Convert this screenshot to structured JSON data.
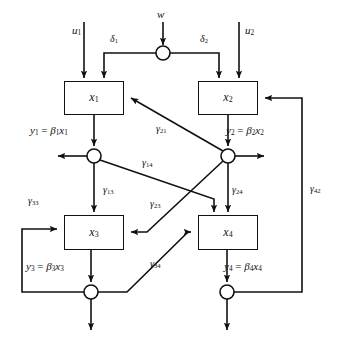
{
  "diagram": {
    "stroke_color": "#111111",
    "background_color": "#ffffff",
    "blocks": [
      {
        "id": "x1",
        "label": "x",
        "sub": "1",
        "x": 64,
        "y": 81,
        "w": 60,
        "h": 34
      },
      {
        "id": "x2",
        "label": "x",
        "sub": "2",
        "x": 198,
        "y": 81,
        "w": 60,
        "h": 34
      },
      {
        "id": "x3",
        "label": "x",
        "sub": "3",
        "x": 64,
        "y": 215,
        "w": 60,
        "h": 35
      },
      {
        "id": "x4",
        "label": "x",
        "sub": "4",
        "x": 198,
        "y": 215,
        "w": 60,
        "h": 35
      }
    ],
    "junctions": [
      {
        "id": "w-split",
        "cx": 163,
        "cy": 53,
        "r": 7
      },
      {
        "id": "sum-y1",
        "cx": 94,
        "cy": 156,
        "r": 7
      },
      {
        "id": "sum-y2",
        "cx": 228,
        "cy": 156,
        "r": 7
      },
      {
        "id": "sum-y3",
        "cx": 91,
        "cy": 292,
        "r": 7
      },
      {
        "id": "sum-y4",
        "cx": 227,
        "cy": 292,
        "r": 7
      }
    ],
    "inputs": [
      {
        "id": "u1",
        "label": "u",
        "sub": "1",
        "lx": 72,
        "ly": 25
      },
      {
        "id": "w",
        "label": "w",
        "sub": "",
        "lx": 157,
        "ly": 9
      },
      {
        "id": "u2",
        "label": "u",
        "sub": "2",
        "lx": 245,
        "ly": 25
      }
    ],
    "split_gains": [
      {
        "id": "delta1",
        "label": "δ",
        "sub": "1",
        "lx": 110,
        "ly": 34
      },
      {
        "id": "delta2",
        "label": "δ",
        "sub": "2",
        "lx": 200,
        "ly": 34
      }
    ],
    "output_equations": [
      {
        "id": "y1",
        "y": "y",
        "ysub": "1",
        "beta": "β",
        "bsub": "1",
        "x": "x",
        "xsub": "1",
        "lx": 30,
        "ly": 125
      },
      {
        "id": "y2",
        "y": "y",
        "ysub": "2",
        "beta": "β",
        "bsub": "2",
        "x": "x",
        "xsub": "2",
        "lx": 226,
        "ly": 125
      },
      {
        "id": "y3",
        "y": "y",
        "ysub": "3",
        "beta": "β",
        "bsub": "3",
        "x": "x",
        "xsub": "3",
        "lx": 26,
        "ly": 261
      },
      {
        "id": "y4",
        "y": "y",
        "ysub": "4",
        "beta": "β",
        "bsub": "4",
        "x": "x",
        "xsub": "4",
        "lx": 224,
        "ly": 261
      }
    ],
    "gains": [
      {
        "id": "g21",
        "label": "γ",
        "sub": "21",
        "lx": 156,
        "ly": 124
      },
      {
        "id": "g14",
        "label": "γ",
        "sub": "14",
        "lx": 142,
        "ly": 158
      },
      {
        "id": "g13",
        "label": "γ",
        "sub": "13",
        "lx": 103,
        "ly": 185
      },
      {
        "id": "g23",
        "label": "γ",
        "sub": "23",
        "lx": 150,
        "ly": 199
      },
      {
        "id": "g24",
        "label": "γ",
        "sub": "24",
        "lx": 232,
        "ly": 185
      },
      {
        "id": "g42",
        "label": "γ",
        "sub": "42",
        "lx": 310,
        "ly": 184
      },
      {
        "id": "g33",
        "label": "γ",
        "sub": "33",
        "lx": 28,
        "ly": 196
      },
      {
        "id": "g34",
        "label": "γ",
        "sub": "34",
        "lx": 150,
        "ly": 259
      }
    ]
  }
}
